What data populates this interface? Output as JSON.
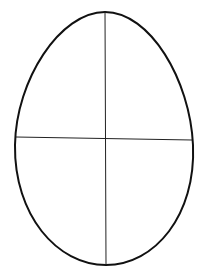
{
  "diagram": {
    "shape": "egg-outline",
    "stroke_color": "#111111",
    "background": "#ffffff",
    "outline": {
      "top": [
        105,
        12
      ],
      "bottom": [
        106,
        265
      ],
      "left_x": 15,
      "right_x": 193,
      "widest_y": 145
    },
    "horizontal_axis": {
      "from": [
        16,
        137
      ],
      "to": [
        192,
        140
      ]
    },
    "vertical_axis": {
      "from": [
        105,
        12
      ],
      "to": [
        106,
        265
      ]
    }
  }
}
